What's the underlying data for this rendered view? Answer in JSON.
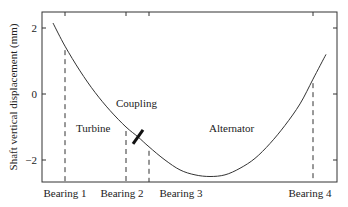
{
  "chart_data": {
    "type": "line",
    "title": "",
    "xlabel": "",
    "ylabel": "Shaft vertical displacement (mm)",
    "ylim": [
      -2.65,
      2.5
    ],
    "yticks": [
      2,
      0,
      -2
    ],
    "ytick_labels": [
      "2",
      "0",
      "−2"
    ],
    "grid": false,
    "legend": null,
    "x_positions_px": {
      "frame_left": 42,
      "frame_right": 337
    },
    "series": [
      {
        "name": "Shaft deflection line",
        "color": "#333333",
        "points": [
          {
            "x": 53,
            "y": 2.15
          },
          {
            "x": 65,
            "y": 1.45
          },
          {
            "x": 80,
            "y": 0.7
          },
          {
            "x": 95,
            "y": 0.05
          },
          {
            "x": 110,
            "y": -0.5
          },
          {
            "x": 126,
            "y": -1.0
          },
          {
            "x": 138,
            "y": -1.3
          },
          {
            "x": 149,
            "y": -1.6
          },
          {
            "x": 165,
            "y": -2.0
          },
          {
            "x": 180,
            "y": -2.3
          },
          {
            "x": 195,
            "y": -2.45
          },
          {
            "x": 210,
            "y": -2.5
          },
          {
            "x": 225,
            "y": -2.45
          },
          {
            "x": 240,
            "y": -2.25
          },
          {
            "x": 255,
            "y": -1.95
          },
          {
            "x": 270,
            "y": -1.5
          },
          {
            "x": 285,
            "y": -0.95
          },
          {
            "x": 300,
            "y": -0.3
          },
          {
            "x": 313,
            "y": 0.45
          },
          {
            "x": 326,
            "y": 1.2
          }
        ]
      }
    ],
    "bearings": [
      {
        "label": "Bearing 1",
        "x": 65,
        "y_top": 1.45
      },
      {
        "label": "Bearing 2",
        "x": 126,
        "y_top": -1.0
      },
      {
        "label": "Bearing 3",
        "x": 149,
        "y_top": -1.6
      },
      {
        "label": "Bearing 4",
        "x": 313,
        "y_top": 0.45
      }
    ],
    "annotations": [
      {
        "text": "Turbine",
        "x": 76,
        "y": -1.05
      },
      {
        "text": "Coupling",
        "x": 116,
        "y": -0.3
      },
      {
        "text": "Alternator",
        "x": 209,
        "y": -1.05
      }
    ],
    "coupling_marker": {
      "x": 138,
      "y": -1.3
    }
  },
  "axis": {
    "ylabel": "Shaft vertical displacement (mm)",
    "yticks": [
      "2",
      "0",
      "−2"
    ]
  },
  "labels": {
    "bearing1": "Bearing 1",
    "bearing2": "Bearing 2",
    "bearing3": "Bearing 3",
    "bearing4": "Bearing 4",
    "turbine": "Turbine",
    "coupling": "Coupling",
    "alternator": "Alternator"
  }
}
